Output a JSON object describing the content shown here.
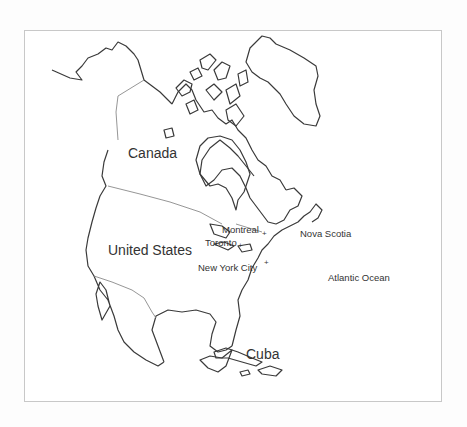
{
  "map": {
    "title": "North America",
    "labels": {
      "canada": "Canada",
      "united_states": "United States",
      "montreal": "Montreal",
      "toronto": "Toronto",
      "new_york": "New York City",
      "nova_scotia": "Nova Scotia",
      "atlantic": "Atlantic Ocean",
      "cuba": "Cuba"
    },
    "colors": {
      "coast": "#3a3a3a",
      "border": "#8a8a8a",
      "background": "#ffffff",
      "frame": "#c8c8c8"
    }
  }
}
